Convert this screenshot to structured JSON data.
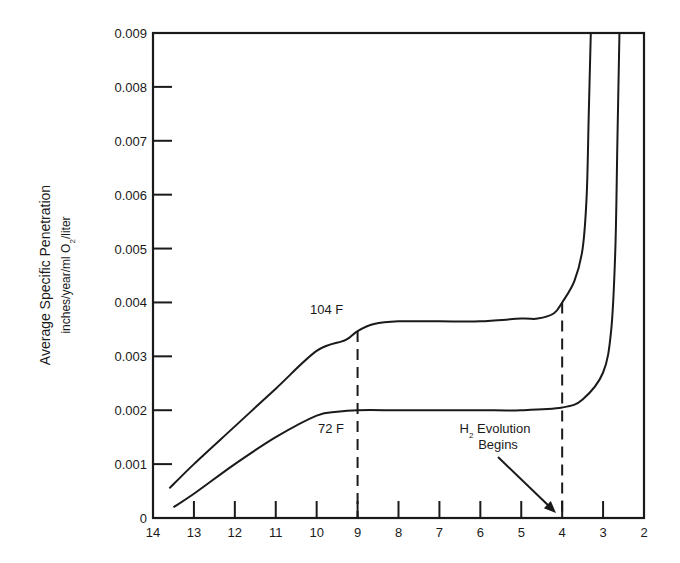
{
  "chart_data": {
    "type": "line",
    "title": "",
    "xlabel": "",
    "ylabel": "Average Specific Penetration",
    "ylabel_units": "inches/year/ml O2/liter",
    "ylabel_units_parts": {
      "pre": "inches/year/ml O",
      "sub": "2",
      "post": "/liter"
    },
    "xlim": [
      14,
      2
    ],
    "ylim": [
      0,
      0.009
    ],
    "x_reversed": true,
    "grid": false,
    "legend": null,
    "x_ticks": [
      14,
      13,
      12,
      11,
      10,
      9,
      8,
      7,
      6,
      5,
      4,
      3,
      2
    ],
    "x_tick_labels": [
      "14",
      "13",
      "12",
      "11",
      "10",
      "9",
      "8",
      "7",
      "6",
      "5",
      "4",
      "3",
      "2"
    ],
    "y_ticks": [
      0,
      0.001,
      0.002,
      0.003,
      0.004,
      0.005,
      0.006,
      0.007,
      0.008,
      0.009
    ],
    "y_tick_labels": [
      "0",
      "0.001",
      "0.002",
      "0.003",
      "0.004",
      "0.005",
      "0.006",
      "0.007",
      "0.008",
      "0.009"
    ],
    "series": [
      {
        "name": "104 F",
        "label": "104 F",
        "x": [
          13.6,
          13.0,
          12.0,
          11.0,
          10.0,
          9.3,
          9.0,
          8.6,
          8.0,
          7.0,
          6.0,
          5.0,
          4.6,
          4.2,
          4.0,
          3.7,
          3.5,
          3.4,
          3.35,
          3.3
        ],
        "y": [
          0.00055,
          0.001,
          0.0017,
          0.0024,
          0.0031,
          0.0033,
          0.00347,
          0.0036,
          0.00365,
          0.00365,
          0.00365,
          0.0037,
          0.0037,
          0.0038,
          0.004,
          0.0044,
          0.005,
          0.006,
          0.0075,
          0.009
        ]
      },
      {
        "name": "72 F",
        "label": "72 F",
        "x": [
          13.5,
          13.0,
          12.0,
          11.0,
          10.0,
          9.5,
          9.0,
          8.0,
          7.0,
          6.0,
          5.0,
          4.0,
          3.5,
          3.0,
          2.8,
          2.7,
          2.65,
          2.6
        ],
        "y": [
          0.0002,
          0.00045,
          0.001,
          0.0015,
          0.0019,
          0.00197,
          0.002,
          0.002,
          0.002,
          0.002,
          0.002,
          0.00205,
          0.0022,
          0.0027,
          0.0035,
          0.005,
          0.007,
          0.009
        ]
      }
    ],
    "reference_lines": [
      {
        "type": "vertical",
        "x": 9,
        "style": "dashed",
        "y_from": 0,
        "y_to": 0.00347
      },
      {
        "type": "vertical",
        "x": 4,
        "style": "dashed",
        "y_from": 0,
        "y_to": 0.004
      }
    ],
    "annotations": [
      {
        "text": "104 F",
        "x": 9.1,
        "y": 0.0038
      },
      {
        "text": "72 F",
        "x": 9.1,
        "y": 0.0017
      },
      {
        "text": "H2 Evolution Begins",
        "text_parts": {
          "h": "H",
          "sub": "2",
          "rest": " Evolution",
          "line2": "Begins"
        },
        "x": 5.2,
        "y": 0.0012,
        "arrow_to": {
          "x": 4.1,
          "y": 0.0
        }
      }
    ]
  }
}
